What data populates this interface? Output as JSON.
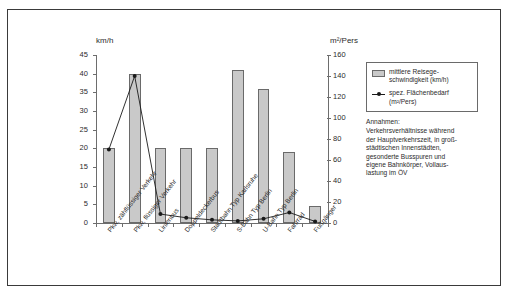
{
  "chart_data": {
    "type": "bar",
    "title": "",
    "categories": [
      "Pkw, zähflüssiger Verkehr",
      "Pkw, flüssiger Verkehr",
      "Linienbus",
      "Doppeldeckerbus",
      "Stadtbahn Typ Karlsruhe",
      "S-Bahn Typ Berlin",
      "U-Bahn Typ Berlin",
      "Fahrrad",
      "Fußgänger"
    ],
    "series": [
      {
        "name": "mittlere Reisegeschwindigkeit (km/h)",
        "type": "bar",
        "axis": "left",
        "unit": "km/h",
        "values": [
          20,
          40,
          20,
          20,
          20,
          41,
          36,
          19,
          4.5
        ]
      },
      {
        "name": "spez. Flächenbedarf (m²/Pers)",
        "type": "line",
        "axis": "right",
        "unit": "m²/Pers",
        "values": [
          70,
          140,
          8.5,
          5,
          3,
          2,
          4,
          10,
          1.5
        ]
      }
    ],
    "ylabel_left": "km/h",
    "ylabel_right": "m²/Pers",
    "xlabel": "",
    "ylim_left": [
      0,
      45
    ],
    "ylim_right": [
      0,
      160
    ],
    "yticks_left": [
      0,
      5,
      10,
      15,
      20,
      25,
      30,
      35,
      40,
      45
    ],
    "yticks_right": [
      0,
      20,
      40,
      60,
      80,
      100,
      120,
      140,
      160
    ],
    "grid": false,
    "legend_position": "right",
    "colors": {
      "bar_fill": "#c9c9c9",
      "bar_stroke": "#6a6a6a",
      "line": "#1a1a1a",
      "axis": "#6d6d6d",
      "frame": "#3a3a3a",
      "text": "#2b2b2b",
      "background": "#ffffff"
    }
  },
  "legend": {
    "entries": [
      {
        "label_line1": "mittlere Reisege-",
        "label_line2": "schwindigkeit (km/h)",
        "marker": "bar-swatch"
      },
      {
        "label_line1": "spez. Flächenbedarf",
        "label_line2": "(m²/Pers)",
        "marker": "line-marker"
      }
    ]
  },
  "annotation": {
    "heading": "Annahmen:",
    "line1": "Verkehrsverhältnisse während",
    "line2": "der Hauptverkehrszeit, in groß-",
    "line3": "städtischen Innenstädten,",
    "line4": "gesonderte Busspuren und",
    "line5": "eigene Bahnkörper, Vollaus-",
    "line6": "lastung im ÖV"
  }
}
